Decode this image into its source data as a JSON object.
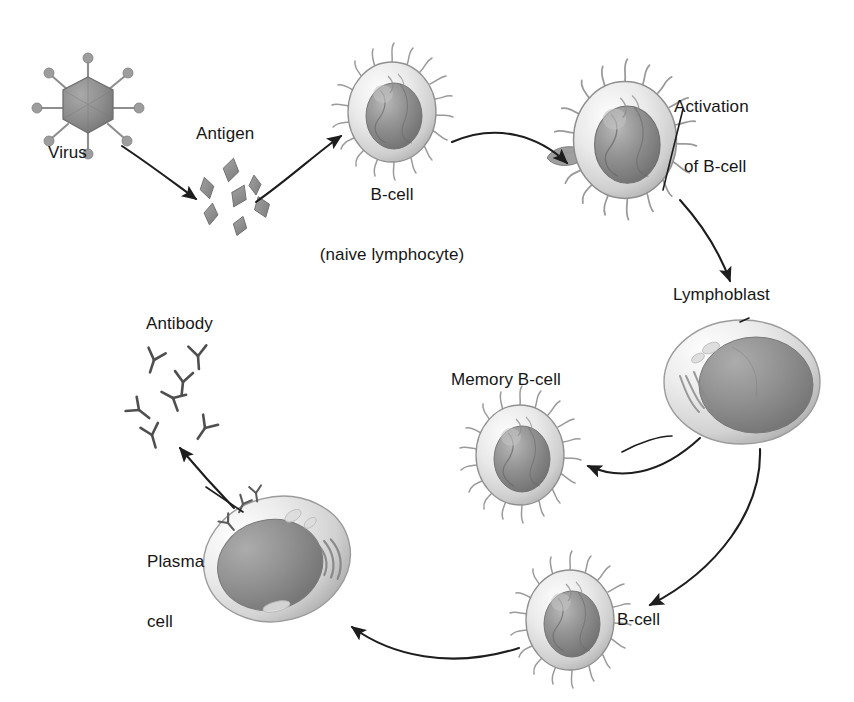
{
  "figure": {
    "kind": "biology-diagram",
    "background_color": "#ffffff",
    "ink_color": "#161616"
  },
  "labels": {
    "virus": "Virus",
    "antigen": "Antigen",
    "bcell_naive_line1": "B-cell",
    "bcell_naive_line2": "(naive lymphocyte)",
    "activation_line1": "Activation",
    "activation_line2": "of B-cell",
    "lymphoblast": "Lymphoblast",
    "memory_bcell": "Memory B-cell",
    "bcell_lower": "B-cell",
    "plasma_line1": "Plasma",
    "plasma_line2": "cell",
    "antibody": "Antibody"
  },
  "nodes": [
    {
      "id": "virus",
      "name": "virus-particle",
      "label": "Virus",
      "cx": 88,
      "cy": 105,
      "shape": "hexagonal-capsid-with-spikes",
      "fill": "#8e8e8e"
    },
    {
      "id": "antigen",
      "name": "antigen-fragments",
      "label": "Antigen",
      "cx": 238,
      "cy": 190,
      "shape": "diamond-cluster",
      "count": 7,
      "fill": "#8a8a8a"
    },
    {
      "id": "bcell-naive",
      "name": "b-cell-naive",
      "label": "B-cell (naive lymphocyte)",
      "cx": 392,
      "cy": 112,
      "rx": 44,
      "ry": 50,
      "shape": "spiked-round-cell"
    },
    {
      "id": "bcell-activated",
      "name": "b-cell-activated",
      "label": "Activation of B-cell",
      "cx": 625,
      "cy": 140,
      "rx": 52,
      "ry": 58,
      "shape": "spiked-round-cell-with-pseudopod"
    },
    {
      "id": "lymphoblast",
      "name": "lymphoblast-cell",
      "label": "Lymphoblast",
      "cx": 742,
      "cy": 382,
      "rx": 78,
      "ry": 62,
      "shape": "large-oval-cell-with-er"
    },
    {
      "id": "memory-bcell",
      "name": "memory-b-cell",
      "label": "Memory B-cell",
      "cx": 520,
      "cy": 455,
      "rx": 44,
      "ry": 50,
      "shape": "spiked-round-cell"
    },
    {
      "id": "bcell-lower",
      "name": "b-cell-daughter",
      "label": "B-cell",
      "cx": 570,
      "cy": 620,
      "rx": 44,
      "ry": 50,
      "shape": "spiked-round-cell"
    },
    {
      "id": "plasma-cell",
      "name": "plasma-cell",
      "label": "Plasma cell",
      "cx": 277,
      "cy": 559,
      "rx": 74,
      "ry": 62,
      "shape": "large-oval-cell-with-er"
    },
    {
      "id": "antibody",
      "name": "antibody-cluster",
      "label": "Antibody",
      "cx": 185,
      "cy": 395,
      "shape": "y-shaped-molecules",
      "count": 7
    }
  ],
  "arrows": [
    {
      "id": "a1",
      "name": "arrow-virus-to-antigen",
      "from": "virus",
      "to": "antigen",
      "style": "curved"
    },
    {
      "id": "a2",
      "name": "arrow-antigen-to-bcell",
      "from": "antigen",
      "to": "bcell-naive",
      "style": "curved"
    },
    {
      "id": "a3",
      "name": "arrow-bcell-to-activation",
      "from": "bcell-naive",
      "to": "bcell-activated",
      "style": "curved"
    },
    {
      "id": "a4",
      "name": "arrow-activation-to-lymphoblast",
      "from": "bcell-activated",
      "to": "lymphoblast",
      "style": "curved"
    },
    {
      "id": "a5",
      "name": "arrow-lymphoblast-to-memory",
      "from": "lymphoblast",
      "to": "memory-bcell",
      "style": "curved"
    },
    {
      "id": "a6",
      "name": "arrow-lymphoblast-to-bcell",
      "from": "lymphoblast",
      "to": "bcell-lower",
      "style": "curved"
    },
    {
      "id": "a7",
      "name": "arrow-bcell-to-plasma",
      "from": "bcell-lower",
      "to": "plasma-cell",
      "style": "curved"
    },
    {
      "id": "a8",
      "name": "arrow-plasma-to-antibody",
      "from": "plasma-cell",
      "to": "antibody",
      "style": "curved"
    }
  ],
  "leader_lines": [
    {
      "id": "l1",
      "name": "leader-line-activation-label",
      "target": "bcell-activated"
    },
    {
      "id": "l2",
      "name": "leader-line-lymphoblast-label",
      "target": "lymphoblast"
    },
    {
      "id": "l3",
      "name": "leader-line-plasma-label",
      "target": "plasma-cell"
    }
  ]
}
